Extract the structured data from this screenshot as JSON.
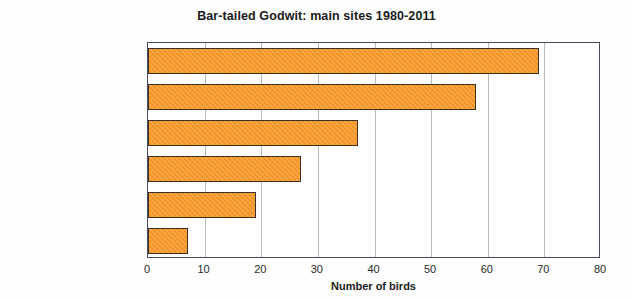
{
  "chart_data": {
    "type": "bar",
    "orientation": "horizontal",
    "title": "Bar-tailed Godwit: main sites 1980-2011",
    "xlabel": "Number of birds",
    "ylabel": "",
    "categories": [
      "Carsington Water",
      "Middleton Moor",
      "Willington GP",
      "Ogston Res",
      "Elvaston Quarry",
      "Drakelow NR"
    ],
    "values": [
      69,
      58,
      37,
      27,
      19,
      7
    ],
    "xlim": [
      0,
      80
    ],
    "xticks": [
      0,
      10,
      20,
      30,
      40,
      50,
      60,
      70,
      80
    ],
    "xtick_labels": [
      "0",
      "10",
      "20",
      "30",
      "40",
      "50",
      "60",
      "70",
      "80"
    ],
    "grid": "vertical",
    "legend": "none",
    "bar_color": "#f7941d",
    "bar_edge_color": "#3a3024",
    "plot_border_color": "#4a4a5e",
    "gridline_color": "#b9b9c4",
    "background_color": "#ffffff"
  }
}
